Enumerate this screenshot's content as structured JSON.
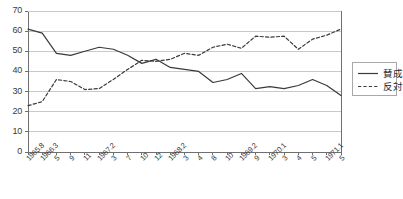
{
  "chart_data": {
    "type": "line",
    "title": "",
    "xlabel": "",
    "ylabel": "",
    "ylim": [
      0,
      70
    ],
    "ytick_step": 10,
    "yticks": [
      70,
      60,
      50,
      40,
      30,
      20,
      10,
      0
    ],
    "grid": true,
    "legend_position": "right",
    "categories": [
      "1965.8",
      "1966.3",
      "5",
      "9",
      "11",
      "1967.2",
      "3",
      "7",
      "10",
      "12",
      "1968.2",
      "3",
      "4",
      "8",
      "10",
      "1969.2",
      "9",
      "1970.1",
      "3",
      "4",
      "5",
      "1971.1",
      "5"
    ],
    "series": [
      {
        "name": "賛成",
        "style": "solid",
        "color": "#3a3a3a",
        "values": [
          61,
          59,
          49,
          48,
          50,
          52,
          51,
          48,
          44,
          46,
          42,
          41,
          40,
          34.5,
          36,
          39,
          31.5,
          32.5,
          31.5,
          33,
          36,
          33,
          28
        ]
      },
      {
        "name": "反対",
        "style": "dashed",
        "color": "#3a3a3a",
        "values": [
          23,
          25,
          36,
          35,
          31,
          31.5,
          36,
          41,
          45.5,
          45,
          46,
          49,
          48,
          52,
          53.5,
          51.5,
          57.5,
          57,
          57.5,
          51,
          56,
          58,
          61
        ]
      }
    ]
  },
  "legend": {
    "items": [
      {
        "label": "賛成",
        "style": "solid"
      },
      {
        "label": "反対",
        "style": "dashed"
      }
    ]
  },
  "colors": {
    "line": "#3a3a3a",
    "grid": "#c9c9c9",
    "axis": "#6f6f6f",
    "text": "#3a3a3a",
    "legend_border": "#a8a8a8",
    "background": "#ffffff"
  }
}
